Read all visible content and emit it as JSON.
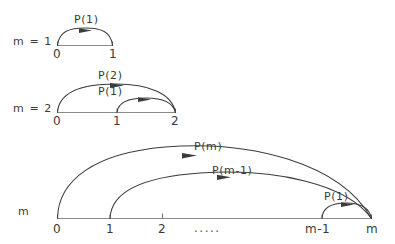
{
  "figure": {
    "title": "",
    "background_color": "#ffffff",
    "ink_color": "#3c3c3c",
    "axis_color": "#8a8a8a"
  },
  "rows": [
    {
      "id": "row-1",
      "row_label": "m = 1",
      "axis_ticks": [
        "0",
        "1"
      ],
      "arcs": [
        {
          "label": "P(1)",
          "from_tick": "0",
          "to_tick": "1"
        }
      ]
    },
    {
      "id": "row-2",
      "row_label": "m = 2",
      "axis_ticks": [
        "0",
        "1",
        "2"
      ],
      "arcs": [
        {
          "label": "P(2)",
          "from_tick": "0",
          "to_tick": "2"
        },
        {
          "label": "P(1)",
          "from_tick": "1",
          "to_tick": "2"
        }
      ]
    },
    {
      "id": "row-3",
      "row_label": "m",
      "axis_ticks": [
        "0",
        "1",
        "2",
        ".....",
        "m-1",
        "m"
      ],
      "arcs": [
        {
          "label": "P(m)",
          "from_tick": "0",
          "to_tick": "m"
        },
        {
          "label": "P(m-1)",
          "from_tick": "1",
          "to_tick": "m"
        },
        {
          "label": "P(1)",
          "from_tick": "m-1",
          "to_tick": "m"
        }
      ]
    }
  ],
  "labels": {
    "row1_name": "m = 1",
    "row1_tick0": "0",
    "row1_tick1": "1",
    "row1_arc1": "P(1)",
    "row2_name": "m = 2",
    "row2_tick0": "0",
    "row2_tick1": "1",
    "row2_tick2": "2",
    "row2_arc_outer": "P(2)",
    "row2_arc_inner": "P(1)",
    "row3_name": "m",
    "row3_tick0": "0",
    "row3_tick1": "1",
    "row3_tick2": "2",
    "row3_tick_dots": ".....",
    "row3_tick_mminus1": "m-1",
    "row3_tick_m": "m",
    "row3_arc_outer": "P(m)",
    "row3_arc_middle": "P(m-1)",
    "row3_arc_inner": "P(1)"
  }
}
